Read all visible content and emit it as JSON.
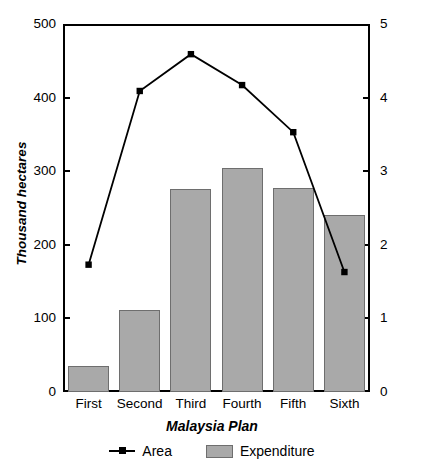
{
  "chart_data": {
    "type": "bar",
    "title": "",
    "categories": [
      "First",
      "Second",
      "Third",
      "Fourth",
      "Fifth",
      "Sixth"
    ],
    "xlabel": "Malaysia Plan",
    "grid": false,
    "legend_position": "bottom",
    "axes": {
      "left": {
        "label": "Thousand hectares",
        "ticks": [
          "0",
          "100",
          "200",
          "300",
          "400",
          "500"
        ],
        "tick_values": [
          0,
          100,
          200,
          300,
          400,
          500
        ],
        "ylim": [
          0,
          500
        ]
      },
      "right": {
        "label": "Billion RM (1978)",
        "ticks": [
          "0",
          "1",
          "2",
          "3",
          "4",
          "5"
        ],
        "tick_values": [
          0,
          1,
          2,
          3,
          4,
          5
        ],
        "ylim": [
          0,
          5
        ]
      }
    },
    "series": [
      {
        "name": "Expenditure",
        "type": "bar",
        "axis": "right",
        "unit": "Billion RM (1978)",
        "color": "#a9a9a9",
        "values": [
          0.35,
          1.11,
          2.76,
          3.05,
          2.77,
          2.4
        ]
      },
      {
        "name": "Area",
        "type": "line",
        "axis": "left",
        "unit": "Thousand hectares",
        "color": "#000000",
        "values": [
          173,
          409,
          459,
          417,
          353,
          163
        ]
      }
    ]
  },
  "legend": {
    "items": [
      {
        "label": "Area",
        "marker": "line-marker"
      },
      {
        "label": "Expenditure",
        "marker": "bar-swatch"
      }
    ]
  }
}
